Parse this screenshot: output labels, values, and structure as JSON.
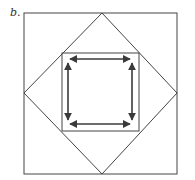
{
  "figure": {
    "label": "b.",
    "colors": {
      "line": "#444444",
      "arrow": "#3a3a3a",
      "background": "#ffffff"
    },
    "outer_square": {
      "x1": 24,
      "y1": 13,
      "x2": 177,
      "y2": 174
    },
    "diamond": {
      "top": [
        102,
        13
      ],
      "right": [
        177,
        93
      ],
      "bottom": [
        102,
        174
      ],
      "left": [
        24,
        93
      ]
    },
    "inner_square": {
      "x1": 62,
      "y1": 53,
      "x2": 139,
      "y2": 131
    },
    "arrows": [
      {
        "name": "top-double-arrow",
        "from": [
          70,
          59
        ],
        "to": [
          130,
          59
        ]
      },
      {
        "name": "bottom-double-arrow",
        "from": [
          70,
          124
        ],
        "to": [
          130,
          124
        ]
      },
      {
        "name": "left-double-arrow",
        "from": [
          68,
          63
        ],
        "to": [
          68,
          120
        ]
      },
      {
        "name": "right-double-arrow",
        "from": [
          132,
          63
        ],
        "to": [
          132,
          120
        ]
      }
    ]
  }
}
